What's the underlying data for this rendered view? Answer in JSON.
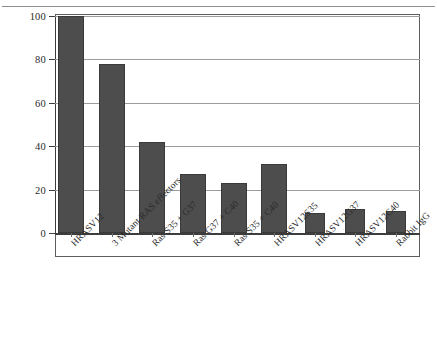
{
  "chart_data": {
    "type": "bar",
    "title": "",
    "xlabel": "",
    "ylabel": "BrdU labelling index (%)",
    "ylim": [
      0,
      100
    ],
    "yticks": [
      0,
      20,
      40,
      60,
      80,
      100
    ],
    "ytick_labels": [
      "0",
      "20",
      "40",
      "60",
      "80",
      "100"
    ],
    "grid": true,
    "grid_axis": "y",
    "legend": "none",
    "bar_color": "#4d4d4d",
    "categories": [
      "HRASV12",
      "3 Mutant RAS effectors",
      "Ras S35 + G37",
      "Ras G37 + C40",
      "Ras S35 + C40",
      "HRASV12S35",
      "HRASV12G37",
      "HRASV12C40",
      "Rabbit IgG"
    ],
    "values": [
      100,
      78,
      42,
      27,
      23,
      32,
      9,
      11,
      10
    ]
  }
}
